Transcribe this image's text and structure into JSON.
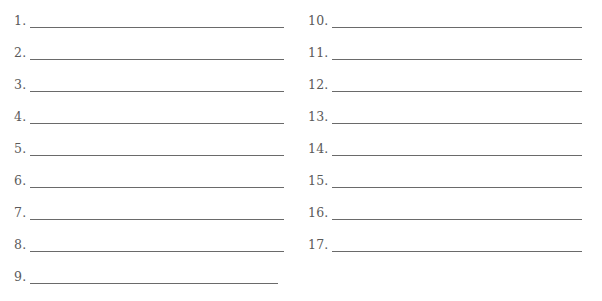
{
  "worksheet": {
    "left_column": [
      {
        "label": "1.",
        "value": ""
      },
      {
        "label": "2.",
        "value": ""
      },
      {
        "label": "3.",
        "value": ""
      },
      {
        "label": "4.",
        "value": ""
      },
      {
        "label": "5.",
        "value": ""
      },
      {
        "label": "6.",
        "value": ""
      },
      {
        "label": "7.",
        "value": ""
      },
      {
        "label": "8.",
        "value": ""
      },
      {
        "label": "9.",
        "value": ""
      }
    ],
    "right_column": [
      {
        "label": "10.",
        "value": ""
      },
      {
        "label": "11.",
        "value": ""
      },
      {
        "label": "12.",
        "value": ""
      },
      {
        "label": "13.",
        "value": ""
      },
      {
        "label": "14.",
        "value": ""
      },
      {
        "label": "15.",
        "value": ""
      },
      {
        "label": "16.",
        "value": ""
      },
      {
        "label": "17.",
        "value": ""
      }
    ]
  }
}
